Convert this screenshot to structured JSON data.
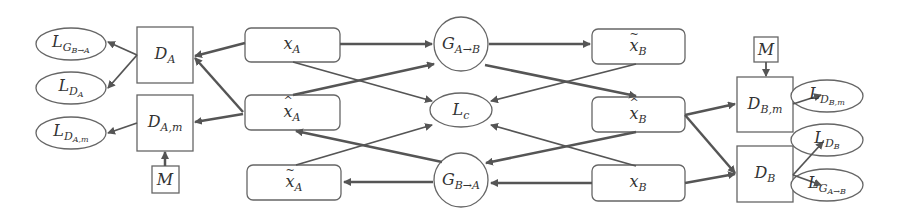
{
  "diagram": {
    "nodes": {
      "L_G_BA": {
        "base": "L",
        "sub": "G",
        "subsub": "B→A"
      },
      "L_DA": {
        "base": "L",
        "sub": "D",
        "subsub": "A"
      },
      "L_DAm": {
        "base": "L",
        "sub": "D",
        "subsub": "A,m"
      },
      "D_A": {
        "base": "D",
        "sub": "A"
      },
      "D_Am": {
        "base": "D",
        "sub": "A,m"
      },
      "M_A": {
        "base": "M"
      },
      "x_A": {
        "base": "x",
        "sub": "A"
      },
      "xhat_A": {
        "base": "x",
        "sub": "A",
        "accent": "^"
      },
      "xtilde_A": {
        "base": "x",
        "sub": "A",
        "accent": "~"
      },
      "G_AB": {
        "base": "G",
        "sub": "A→B"
      },
      "L_c": {
        "base": "L",
        "sub": "c"
      },
      "G_BA": {
        "base": "G",
        "sub": "B→A"
      },
      "xtilde_B": {
        "base": "x",
        "sub": "B",
        "accent": "~"
      },
      "xhat_B": {
        "base": "x",
        "sub": "B",
        "accent": "^"
      },
      "x_B": {
        "base": "x",
        "sub": "B"
      },
      "M_B": {
        "base": "M"
      },
      "D_Bm": {
        "base": "D",
        "sub": "B,m"
      },
      "D_B": {
        "base": "D",
        "sub": "B"
      },
      "L_DBm": {
        "base": "L",
        "sub": "D",
        "subsub": "B,m"
      },
      "L_DB": {
        "base": "L",
        "sub": "D",
        "subsub": "B"
      },
      "L_G_AB": {
        "base": "L",
        "sub": "G",
        "subsub": "A→B"
      }
    },
    "edges": [
      [
        "x_A",
        "D_A"
      ],
      [
        "xhat_A",
        "D_A"
      ],
      [
        "xhat_A",
        "D_Am"
      ],
      [
        "M_A",
        "D_Am"
      ],
      [
        "D_A",
        "L_G_BA"
      ],
      [
        "D_A",
        "L_DA"
      ],
      [
        "D_Am",
        "L_DAm"
      ],
      [
        "x_A",
        "G_AB"
      ],
      [
        "x_A",
        "L_c"
      ],
      [
        "xhat_A",
        "G_AB"
      ],
      [
        "xtilde_A",
        "L_c"
      ],
      [
        "G_BA",
        "xhat_A"
      ],
      [
        "G_BA",
        "xtilde_A"
      ],
      [
        "G_AB",
        "xtilde_B"
      ],
      [
        "G_AB",
        "xhat_B"
      ],
      [
        "xtilde_B",
        "L_c"
      ],
      [
        "x_B",
        "L_c"
      ],
      [
        "xhat_B",
        "G_BA"
      ],
      [
        "x_B",
        "G_BA"
      ],
      [
        "xhat_B",
        "D_Bm"
      ],
      [
        "xhat_B",
        "D_B"
      ],
      [
        "x_B",
        "D_B"
      ],
      [
        "M_B",
        "D_Bm"
      ],
      [
        "D_Bm",
        "L_DBm"
      ],
      [
        "D_B",
        "L_DB"
      ],
      [
        "D_B",
        "L_G_AB"
      ]
    ],
    "colors": {
      "stroke": "#555555",
      "arrow": "#555555",
      "text": "#333333",
      "fill": "#ffffff"
    }
  }
}
